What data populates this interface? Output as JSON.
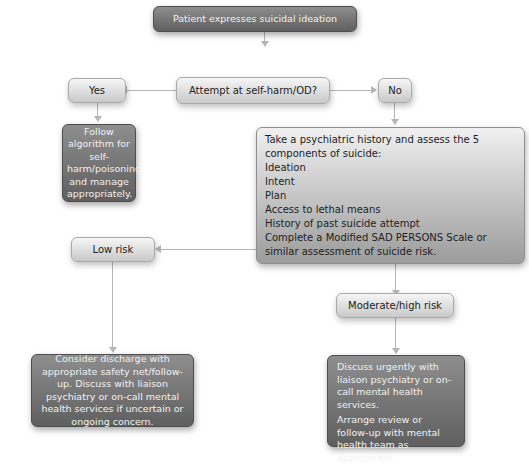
{
  "nodes": {
    "start": "Patient expresses suicidal ideation",
    "decision": "Attempt at self-harm/OD?",
    "yes": "Yes",
    "no": "No",
    "yes_action": "Follow algorithm for self-harm/poisoning and manage appropriately.",
    "assessment": {
      "intro": "Take a psychiatric history and assess the 5 components of suicide:",
      "components": [
        "Ideation",
        "Intent",
        "Plan",
        "Access to lethal means",
        "History of past suicide attempt"
      ],
      "scale": "Complete a Modified SAD PERSONS Scale or similar assessment of suicide risk."
    },
    "low_risk": "Low risk",
    "low_risk_action": "Consider discharge with appropriate safety net/follow-up. Discuss with liaison psychiatry or on-call mental health services if uncertain or ongoing concern.",
    "moderate_risk": "Moderate/high risk",
    "moderate_risk_action": {
      "p1": "Discuss urgently with liaison psychiatry or on-call mental health services.",
      "p2": "Arrange review or follow-up with mental health team as appropriate."
    }
  }
}
